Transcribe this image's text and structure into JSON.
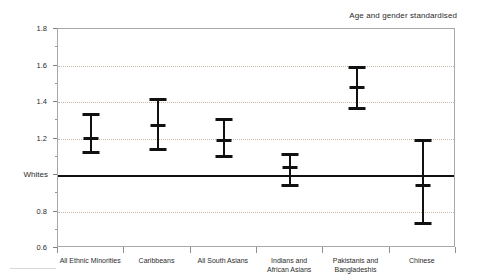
{
  "chart_data": {
    "type": "scatter",
    "title": "",
    "annotation": "Age and gender standardised",
    "xlabel": "",
    "ylabel": "",
    "ylim": [
      0.6,
      1.8
    ],
    "ytick_values": [
      0.6,
      0.8,
      1.0,
      1.2,
      1.4,
      1.6,
      1.8
    ],
    "ytick_labels": [
      "0.6",
      "0.8",
      "Whites",
      "1.2",
      "1.4",
      "1.6",
      "1.8"
    ],
    "y_minor_ticks": [
      0.7,
      0.9,
      1.1,
      1.3,
      1.5,
      1.7
    ],
    "gridlines": [
      0.8,
      1.2,
      1.4,
      1.6
    ],
    "grid": true,
    "legend": "none",
    "reference_line": {
      "value": 1.0,
      "label": "Whites"
    },
    "categories": [
      "All Ethnic Minorities",
      "Caribbeans",
      "All South Asians",
      "Indians and\nAfrican Asians",
      "Pakistanis and\nBangladeshis",
      "Chinese"
    ],
    "values": [
      1.21,
      1.28,
      1.2,
      1.05,
      1.49,
      0.95
    ],
    "ci_lower": [
      1.13,
      1.15,
      1.11,
      0.95,
      1.37,
      0.74
    ],
    "ci_upper": [
      1.34,
      1.42,
      1.31,
      1.12,
      1.6,
      1.2
    ],
    "points": [
      {
        "category": "All Ethnic Minorities",
        "value": 1.21,
        "low": 1.13,
        "high": 1.34
      },
      {
        "category": "Caribbeans",
        "value": 1.28,
        "low": 1.15,
        "high": 1.42
      },
      {
        "category": "All South Asians",
        "value": 1.2,
        "low": 1.11,
        "high": 1.31
      },
      {
        "category": "Indians and African Asians",
        "value": 1.05,
        "low": 0.95,
        "high": 1.12
      },
      {
        "category": "Pakistanis and Bangladeshis",
        "value": 1.49,
        "low": 1.37,
        "high": 1.6
      },
      {
        "category": "Chinese",
        "value": 0.95,
        "low": 0.74,
        "high": 1.2
      }
    ]
  },
  "colors": {
    "marker": "#111111",
    "grid": "#c9b9a8",
    "frame": "#a8a8a8",
    "text": "#2b2b2b",
    "reference": "#111111"
  }
}
